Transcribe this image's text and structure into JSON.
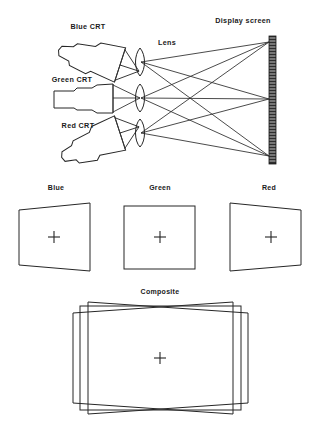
{
  "figure": {
    "title_top_right": "Display screen",
    "lens_label": "Lens",
    "crt_labels": [
      {
        "id": "blue-crt",
        "text": "Blue CRT"
      },
      {
        "id": "green-crt",
        "text": "Green CRT"
      },
      {
        "id": "red-crt",
        "text": "Red CRT"
      }
    ],
    "channel_labels": [
      {
        "id": "blue",
        "text": "Blue"
      },
      {
        "id": "green",
        "text": "Green"
      },
      {
        "id": "red",
        "text": "Red"
      }
    ],
    "composite_label": "Composite",
    "colors": {
      "ink": "#262626",
      "ink_soft": "#2b2b2b",
      "screen_fill": "#2e2e2e",
      "background": "#ffffff"
    },
    "geometry": {
      "screen_x": 272,
      "screen_top": 36,
      "screen_bottom": 163,
      "ray_targets_y": [
        42,
        99,
        156
      ],
      "lens_x": [
        140,
        140,
        140
      ],
      "lens_y": [
        62,
        98,
        133
      ]
    },
    "notes": {
      "blue_distortion": "keystone, right edge taller",
      "green_distortion": "undistorted rectangle",
      "red_distortion": "keystone, left edge taller",
      "composite_distortion": "three overlaid keystones crossing at top and bottom centers"
    }
  }
}
